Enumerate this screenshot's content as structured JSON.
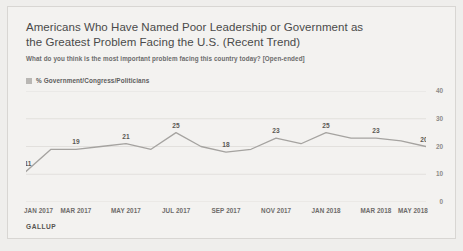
{
  "chart_data": {
    "type": "line",
    "title": "Americans Who Have Named Poor Leadership or Government as the Greatest Problem Facing the U.S. (Recent Trend)",
    "subtitle": "What do you think is the most important problem facing this country today? [Open-ended]",
    "source": "GALLUP",
    "legend": [
      {
        "label": "% Government/Congress/Politicians",
        "color": "#b9b7b4"
      }
    ],
    "legend_position": "top-left",
    "series": [
      {
        "name": "% Government/Congress/Politicians",
        "color": "#a5a3a0",
        "values": [
          11,
          19,
          19,
          20,
          21,
          19,
          25,
          20,
          18,
          19,
          23,
          21,
          25,
          23,
          23,
          22,
          20
        ],
        "labeled": [
          {
            "index": 0,
            "value": 11
          },
          {
            "index": 2,
            "value": 19
          },
          {
            "index": 4,
            "value": 21
          },
          {
            "index": 6,
            "value": 25
          },
          {
            "index": 8,
            "value": 18
          },
          {
            "index": 10,
            "value": 23
          },
          {
            "index": 12,
            "value": 25
          },
          {
            "index": 14,
            "value": 23
          },
          {
            "index": 16,
            "value": 20
          }
        ]
      }
    ],
    "x": [
      "JAN 2017",
      "FEB 2017",
      "MAR 2017",
      "APR 2017",
      "MAY 2017",
      "JUN 2017",
      "JUL 2017",
      "AUG 2017",
      "SEP 2017",
      "OCT 2017",
      "NOV 2017",
      "DEC 2017",
      "JAN 2018",
      "FEB 2018",
      "MAR 2018",
      "APR 2018",
      "MAY 2018"
    ],
    "xticks": [
      "JAN 2017",
      "MAR 2017",
      "MAY 2017",
      "JUL 2017",
      "SEP 2017",
      "NOV 2017",
      "JAN 2018",
      "MAR 2018",
      "MAY 2018"
    ],
    "xtick_indices": [
      0,
      2,
      4,
      6,
      8,
      10,
      12,
      14,
      16
    ],
    "yticks": [
      40,
      30,
      20,
      10,
      0
    ],
    "ylim": [
      0,
      40
    ],
    "xlabel": "",
    "ylabel": "",
    "grid": true,
    "grid_color": "#e2e0dd"
  }
}
